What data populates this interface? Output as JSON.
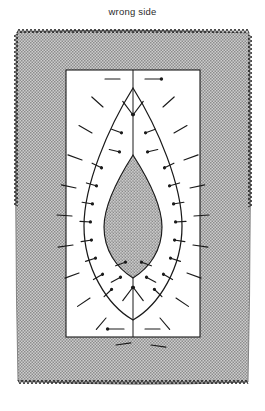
{
  "figure": {
    "caption": "wrong side",
    "title": "wrong side",
    "kind": "sewing-diagram",
    "colors": {
      "background": "#ffffff",
      "fabric_fill": "#b9b9b9",
      "fabric_texture": "#8a8a8a",
      "applique_fill": "#b9b9b9",
      "panel_fill": "#ffffff",
      "line": "#1a1a1a",
      "caption_text": "#2b2b2b",
      "serge_edge": "#151515"
    },
    "parts": [
      {
        "name": "fabric-square",
        "label": "wrong side",
        "fill": "#b9b9b9",
        "edge": "serged"
      },
      {
        "name": "white-panel",
        "label": "",
        "fill": "#ffffff"
      },
      {
        "name": "outer-seam-curve",
        "label": "",
        "fill": "none"
      },
      {
        "name": "applique-shape",
        "label": "",
        "fill": "#b9b9b9"
      },
      {
        "name": "center-line",
        "label": "",
        "fill": "none"
      },
      {
        "name": "pins",
        "label": "",
        "count": 44
      }
    ],
    "geometry": {
      "fabric": {
        "x": 15,
        "y": 30,
        "width": 236,
        "height": 355
      },
      "panel": {
        "x": 66,
        "y": 70,
        "width": 134,
        "height": 267
      },
      "curve_apex_top": [
        133,
        88
      ],
      "curve_apex_bottom": [
        133,
        320
      ],
      "applique_apex_top": [
        133,
        155
      ],
      "applique_apex_bottom": [
        133,
        278
      ]
    },
    "pin_count": 44,
    "serge_stitch_count": 120
  }
}
